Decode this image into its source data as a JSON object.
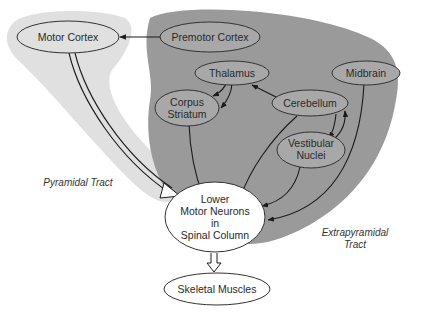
{
  "diagram": {
    "colors": {
      "background": "#ffffff",
      "pyramidal_region": "#e0e0e0",
      "extrapyramidal_region": "#9a9a9a",
      "node_fill_in_region": "#a8a8a8",
      "node_fill_white": "#ffffff",
      "stroke": "#1a1a1a"
    },
    "regions": {
      "pyramidal": {
        "label": "Pyramidal Tract"
      },
      "extrapyramidal": {
        "label_line1": "Extrapyramidal",
        "label_line2": "Tract"
      }
    },
    "nodes": {
      "motor_cortex": {
        "label": "Motor Cortex"
      },
      "premotor_cortex": {
        "label": "Premotor Cortex"
      },
      "thalamus": {
        "label": "Thalamus"
      },
      "corpus_striatum": {
        "line1": "Corpus",
        "line2": "Striatum"
      },
      "cerebellum": {
        "label": "Cerebellum"
      },
      "midbrain": {
        "label": "Midbrain"
      },
      "vestibular_nuclei": {
        "line1": "Vestibular",
        "line2": "Nuclei"
      },
      "lower_motor_neurons": {
        "line1": "Lower",
        "line2": "Motor Neurons",
        "line3": "in",
        "line4": "Spinal Column"
      },
      "skeletal_muscles": {
        "label": "Skeletal Muscles"
      }
    },
    "edges": [
      {
        "from": "Premotor Cortex",
        "to": "Motor Cortex",
        "style": "single"
      },
      {
        "from": "Motor Cortex",
        "to": "Lower Motor Neurons in Spinal Column",
        "style": "double"
      },
      {
        "from": "Thalamus",
        "to": "Corpus Striatum",
        "style": "single"
      },
      {
        "from": "Corpus Striatum",
        "to": "Thalamus",
        "style": "single"
      },
      {
        "from": "Cerebellum",
        "to": "Thalamus",
        "style": "single"
      },
      {
        "from": "Corpus Striatum",
        "to": "Lower Motor Neurons in Spinal Column",
        "style": "single"
      },
      {
        "from": "Cerebellum",
        "to": "Lower Motor Neurons in Spinal Column",
        "style": "single"
      },
      {
        "from": "Cerebellum",
        "to": "Vestibular Nuclei",
        "style": "single"
      },
      {
        "from": "Vestibular Nuclei",
        "to": "Cerebellum",
        "style": "single"
      },
      {
        "from": "Vestibular Nuclei",
        "to": "Lower Motor Neurons in Spinal Column",
        "style": "single"
      },
      {
        "from": "Midbrain",
        "to": "Lower Motor Neurons in Spinal Column",
        "style": "single"
      },
      {
        "from": "Lower Motor Neurons in Spinal Column",
        "to": "Skeletal Muscles",
        "style": "hollow-block"
      }
    ]
  }
}
